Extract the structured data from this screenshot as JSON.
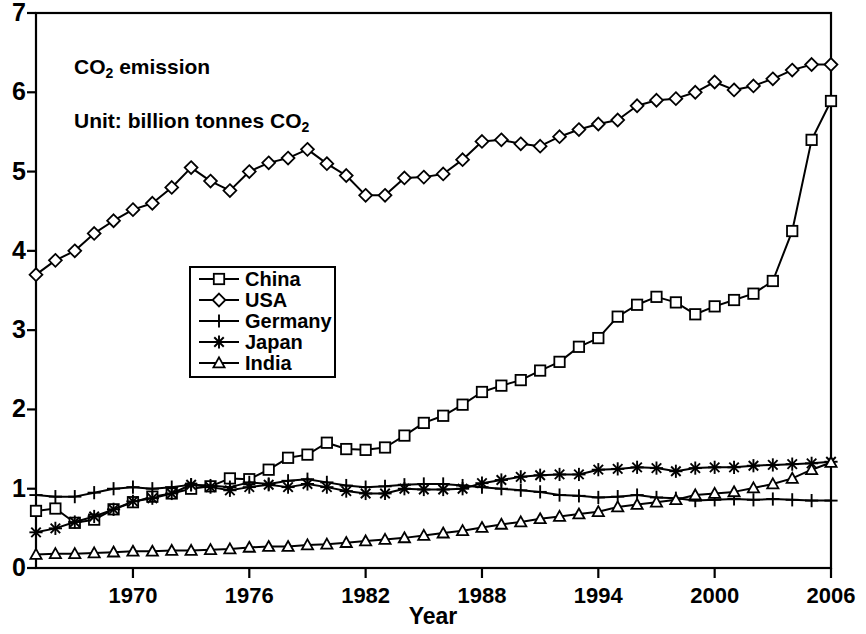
{
  "chart_data": {
    "type": "line",
    "title": "",
    "annotations": [
      "CO2 emission",
      "Unit: billion tonnes CO2"
    ],
    "xlabel": "Year",
    "ylabel": "",
    "xlim": [
      1965,
      2006
    ],
    "ylim": [
      0,
      7
    ],
    "xticks": [
      1970,
      1976,
      1982,
      1988,
      1994,
      2000,
      2006
    ],
    "yticks": [
      0,
      1,
      2,
      3,
      4,
      5,
      6,
      7
    ],
    "grid": false,
    "legend_position": "center-left",
    "x": [
      1965,
      1966,
      1967,
      1968,
      1969,
      1970,
      1971,
      1972,
      1973,
      1974,
      1975,
      1976,
      1977,
      1978,
      1979,
      1980,
      1981,
      1982,
      1983,
      1984,
      1985,
      1986,
      1987,
      1988,
      1989,
      1990,
      1991,
      1992,
      1993,
      1994,
      1995,
      1996,
      1997,
      1998,
      1999,
      2000,
      2001,
      2002,
      2003,
      2004,
      2005,
      2006
    ],
    "series": [
      {
        "name": "China",
        "marker": "square",
        "values": [
          0.72,
          0.75,
          0.57,
          0.61,
          0.74,
          0.83,
          0.9,
          0.94,
          1.0,
          1.03,
          1.13,
          1.12,
          1.24,
          1.39,
          1.43,
          1.58,
          1.5,
          1.49,
          1.52,
          1.67,
          1.83,
          1.92,
          2.06,
          2.22,
          2.3,
          2.37,
          2.49,
          2.6,
          2.79,
          2.9,
          3.17,
          3.32,
          3.42,
          3.35,
          3.2,
          3.3,
          3.38,
          3.46,
          3.62,
          4.25,
          5.4,
          5.89
        ]
      },
      {
        "name": "USA",
        "marker": "diamond",
        "values": [
          3.7,
          3.88,
          4.0,
          4.22,
          4.38,
          4.52,
          4.6,
          4.8,
          5.05,
          4.88,
          4.76,
          5.0,
          5.11,
          5.17,
          5.28,
          5.1,
          4.95,
          4.7,
          4.7,
          4.92,
          4.93,
          4.97,
          5.15,
          5.38,
          5.4,
          5.35,
          5.32,
          5.44,
          5.53,
          5.6,
          5.65,
          5.83,
          5.9,
          5.92,
          6.0,
          6.13,
          6.03,
          6.08,
          6.17,
          6.28,
          6.35,
          6.35
        ]
      },
      {
        "name": "Germany",
        "marker": "plus",
        "values": [
          0.92,
          0.9,
          0.9,
          0.95,
          1.0,
          1.02,
          1.0,
          1.02,
          1.05,
          1.04,
          1.02,
          1.08,
          1.06,
          1.1,
          1.12,
          1.08,
          1.04,
          1.02,
          1.03,
          1.05,
          1.06,
          1.06,
          1.04,
          1.02,
          1.0,
          0.98,
          0.96,
          0.92,
          0.91,
          0.89,
          0.9,
          0.92,
          0.89,
          0.88,
          0.85,
          0.86,
          0.87,
          0.86,
          0.87,
          0.86,
          0.85,
          0.85
        ]
      },
      {
        "name": "Japan",
        "marker": "asterisk",
        "values": [
          0.45,
          0.5,
          0.58,
          0.65,
          0.74,
          0.84,
          0.88,
          0.94,
          1.05,
          1.02,
          0.98,
          1.02,
          1.05,
          1.02,
          1.06,
          1.02,
          0.97,
          0.94,
          0.94,
          1.0,
          0.99,
          0.99,
          1.0,
          1.07,
          1.11,
          1.15,
          1.17,
          1.18,
          1.18,
          1.24,
          1.25,
          1.27,
          1.26,
          1.22,
          1.26,
          1.27,
          1.27,
          1.29,
          1.3,
          1.31,
          1.32,
          1.34
        ]
      },
      {
        "name": "India",
        "marker": "triangle",
        "values": [
          0.17,
          0.18,
          0.18,
          0.19,
          0.2,
          0.21,
          0.21,
          0.22,
          0.22,
          0.23,
          0.24,
          0.26,
          0.27,
          0.27,
          0.29,
          0.3,
          0.32,
          0.34,
          0.36,
          0.38,
          0.41,
          0.44,
          0.47,
          0.51,
          0.55,
          0.58,
          0.62,
          0.65,
          0.68,
          0.71,
          0.77,
          0.8,
          0.83,
          0.86,
          0.92,
          0.94,
          0.96,
          1.01,
          1.06,
          1.13,
          1.24,
          1.33
        ]
      }
    ]
  },
  "axis": {
    "x_title": "Year",
    "x_tick_labels": [
      "1970",
      "1976",
      "1982",
      "1988",
      "1994",
      "2000",
      "2006"
    ],
    "y_tick_labels": [
      "0",
      "1",
      "2",
      "3",
      "4",
      "5",
      "6",
      "7"
    ]
  },
  "annotations": {
    "line1_pre": "CO",
    "line1_sub": "2",
    "line1_post": " emission",
    "line2_pre": "Unit: billion tonnes CO",
    "line2_sub": "2"
  },
  "legend": {
    "entries": [
      {
        "label": "China",
        "marker": "square"
      },
      {
        "label": "USA",
        "marker": "diamond"
      },
      {
        "label": "Germany",
        "marker": "plus"
      },
      {
        "label": "Japan",
        "marker": "asterisk"
      },
      {
        "label": "India",
        "marker": "triangle"
      }
    ]
  },
  "style": {
    "line_color": "#000000",
    "background": "#ffffff"
  }
}
